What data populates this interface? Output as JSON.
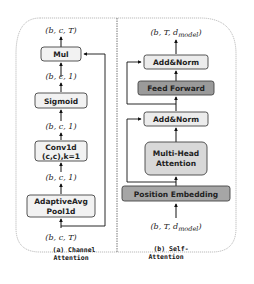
{
  "colors": {
    "background": "#ffffff",
    "border": "#999999",
    "box_stroke": "#444444",
    "light_box": "#eeeeee",
    "mid_box": "#d8d8d8",
    "dark_box": "#9a9a9a",
    "arrow": "#111111"
  },
  "channel_attention": {
    "caption_line1": "(a) Channel",
    "caption_line2": "Attention",
    "input_shape": "(b, c, T)",
    "output_shape": "(b, c, T)",
    "blocks": [
      {
        "id": "pool",
        "line1": "AdaptiveAvg",
        "line2": "Pool1d"
      },
      {
        "id": "conv",
        "line1": "Conv1d",
        "line2": "(c,c),k=1"
      },
      {
        "id": "sigmoid",
        "line1": "Sigmoid"
      },
      {
        "id": "mul",
        "line1": "Mul"
      }
    ],
    "shapes_between": [
      "(b, c, 1)",
      "(b, c, 1)",
      "(b, c, 1)"
    ]
  },
  "self_attention": {
    "caption_line1": "(b) Self-",
    "caption_line2": "Attention",
    "input_shape_prefix": "(b, T, d",
    "input_shape_sub": "model",
    "input_shape_suffix": ")",
    "output_shape_prefix": "(b, T, d",
    "output_shape_sub": "model",
    "output_shape_suffix": ")",
    "blocks": [
      {
        "id": "pos_emb",
        "line1": "Position Embedding"
      },
      {
        "id": "mha",
        "line1": "Multi-Head",
        "line2": "Attention"
      },
      {
        "id": "addnorm1",
        "line1": "Add&Norm"
      },
      {
        "id": "ff",
        "line1": "Feed Forward"
      },
      {
        "id": "addnorm2",
        "line1": "Add&Norm"
      }
    ]
  }
}
